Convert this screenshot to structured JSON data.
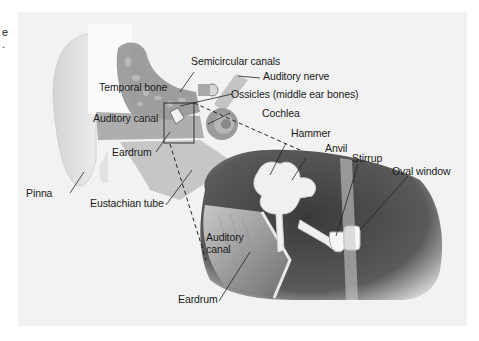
{
  "edge_text": [
    "e",
    "."
  ],
  "labels": {
    "semicircular_canals": "Semicircular canals",
    "auditory_nerve": "Auditory nerve",
    "temporal_bone": "Temporal bone",
    "ossicles": "Ossicles (middle ear bones)",
    "auditory_canal_outer": "Auditory canal",
    "cochlea": "Cochlea",
    "eardrum_outer": "Eardrum",
    "hammer": "Hammer",
    "anvil": "Anvil",
    "stirrup": "Stirrup",
    "oval_window": "Oval window",
    "pinna": "Pinna",
    "eustachian_tube": "Eustachian tube",
    "auditory_canal_inset_1": "Auditory",
    "auditory_canal_inset_2": "canal",
    "eardrum_inset": "Eardrum"
  },
  "colors": {
    "panel_bg": "#f2f2f2",
    "text": "#1a1a1a",
    "tissue_dark": "#4a4a4a",
    "bone_gray": "#9a9a9a"
  }
}
